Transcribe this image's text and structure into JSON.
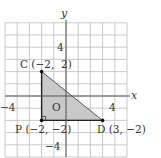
{
  "diagram": {
    "type": "coordinate-plane-triangle",
    "axes": {
      "x_label": "x",
      "y_label": "y",
      "origin_label": "O"
    },
    "ticks": {
      "x_neg": "−4",
      "x_pos": "4",
      "y_pos": "4",
      "y_neg": "−4"
    },
    "grid": {
      "x_min": -5,
      "x_max": 5,
      "y_min": -5,
      "y_max": 6
    },
    "points": [
      {
        "name": "C",
        "x": -2,
        "y": 2,
        "label": "C (−2,  2)"
      },
      {
        "name": "P",
        "x": -2,
        "y": -2,
        "label": "P (−2, −2)"
      },
      {
        "name": "D",
        "x": 3,
        "y": -2,
        "label": "D (3, −2)"
      }
    ],
    "triangle": [
      "C",
      "P",
      "D"
    ],
    "right_angle_at": "P",
    "colors": {
      "fill": "#c9c9c9",
      "grid": "#bdbdbd",
      "axis": "#555555",
      "edge": "#333333"
    }
  }
}
